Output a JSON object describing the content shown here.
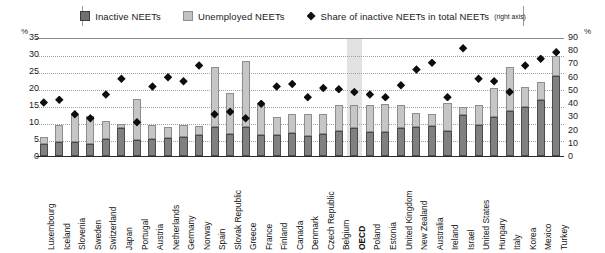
{
  "legend": {
    "items": [
      {
        "key": "inactive",
        "label": "Inactive NEETs",
        "marker": "square-dark-icon"
      },
      {
        "key": "unemployed",
        "label": "Unemployed  NEETs",
        "marker": "square-light-icon"
      },
      {
        "key": "share",
        "label": "Share of inactive NEETs in total NEETs",
        "sublabel": "(right axis)",
        "marker": "diamond-icon"
      }
    ]
  },
  "axes": {
    "left_unit": "%",
    "right_unit": "%",
    "left_ticks": [
      35,
      30,
      25,
      20,
      15,
      10,
      5,
      0
    ],
    "right_ticks": [
      90,
      80,
      70,
      60,
      50,
      40,
      30,
      20,
      10,
      0
    ]
  },
  "chart_data": {
    "type": "bar",
    "title": "",
    "xlabel": "",
    "ylabel": "%",
    "ylim": [
      0,
      35
    ],
    "y2lim": [
      0,
      90
    ],
    "grid": true,
    "legend_position": "top",
    "highlight_category": "OECD",
    "categories": [
      "Luxembourg",
      "Iceland",
      "Slovenia",
      "Sweden",
      "Switzerland",
      "Japan",
      "Portugal",
      "Austria",
      "Netherlands",
      "Germany",
      "Norway",
      "Spain",
      "Slovak Republic",
      "Greece",
      "France",
      "Finland",
      "Canada",
      "Denmark",
      "Czech Republic",
      "Belgium",
      "OECD",
      "Poland",
      "Estonia",
      "United Kingdom",
      "New Zealand",
      "Australia",
      "Ireland",
      "Israel",
      "United States",
      "Hungary",
      "Italy",
      "Korea",
      "Mexico",
      "Turkey"
    ],
    "series": [
      {
        "name": "Inactive NEETs",
        "type": "bar",
        "stack": "neet",
        "color": "#808080",
        "values": [
          3.4,
          4.1,
          4.0,
          3.6,
          5.0,
          8.1,
          4.6,
          5.0,
          5.2,
          5.6,
          6.2,
          8.6,
          6.4,
          8.4,
          6.3,
          6.1,
          6.9,
          5.8,
          6.5,
          7.4,
          8.1,
          7.2,
          7.0,
          8.2,
          8.5,
          8.9,
          7.3,
          12.0,
          9.0,
          11.6,
          13.1,
          14.3,
          16.5,
          23.5
        ]
      },
      {
        "name": "Unemployed NEETs",
        "type": "bar",
        "stack": "neet",
        "color": "#c6c6c6",
        "values": [
          2.2,
          4.9,
          8.1,
          8.3,
          5.2,
          1.3,
          12.1,
          4.2,
          3.3,
          3.4,
          2.6,
          17.6,
          12.0,
          19.6,
          9.0,
          5.3,
          5.4,
          6.6,
          5.8,
          7.5,
          7.0,
          7.8,
          8.2,
          6.7,
          4.2,
          3.4,
          8.4,
          2.5,
          6.0,
          8.5,
          13.0,
          6.1,
          5.4,
          5.9
        ]
      }
    ],
    "share_series": {
      "name": "Share of inactive NEETs in total NEETs",
      "type": "scatter",
      "axis": "right",
      "marker": "diamond",
      "color": "#0d0d0d",
      "values": [
        42,
        44,
        33,
        30,
        48,
        60,
        27,
        54,
        61,
        58,
        70,
        33,
        35,
        30,
        41,
        54,
        56,
        46,
        53,
        52,
        50,
        48,
        46,
        55,
        67,
        72,
        46,
        83,
        60,
        58,
        50,
        70,
        75,
        80
      ]
    }
  }
}
